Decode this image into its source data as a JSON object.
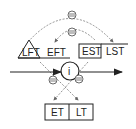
{
  "diagram": {
    "predecessor": {
      "labels": [
        "LFT",
        "EFT"
      ],
      "shape": "triangle"
    },
    "successor": {
      "labels": [
        "EST",
        "LST"
      ]
    },
    "node": {
      "label": "i"
    },
    "bottom": {
      "labels": [
        "ET",
        "LT"
      ]
    },
    "relation_symbol": "minus-circle-icon",
    "colors": {
      "line": "#222222",
      "dashed": "#777777",
      "background": "#ffffff"
    }
  }
}
